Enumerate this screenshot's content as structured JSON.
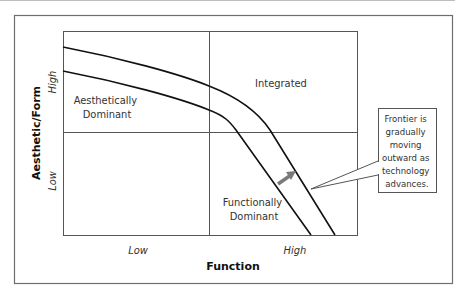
{
  "figure": {
    "quadrants": {
      "top_left": [
        "Aesthetically",
        "Dominant"
      ],
      "top_right": "Integrated",
      "bottom_right": [
        "Functionally",
        "Dominant"
      ]
    },
    "axes": {
      "x_label": "Function",
      "y_label": "Aesthetic/Form",
      "x_ticks": [
        "Low",
        "High"
      ],
      "y_ticks": [
        "Low",
        "High"
      ]
    },
    "callout": {
      "lines": [
        "Frontier is",
        "gradually",
        "moving",
        "outward as",
        "technology",
        "advances."
      ]
    },
    "colors": {
      "frame": "#6e6e6e",
      "grid": "#555555",
      "curve": "#111111",
      "arrow": "#7a7a7a",
      "text": "#333333"
    }
  }
}
